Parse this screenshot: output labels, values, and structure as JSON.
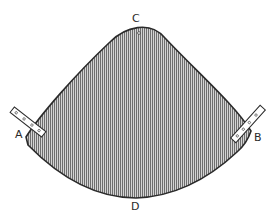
{
  "figure": {
    "colors": {
      "outline": "#2b2b2b",
      "hatch": "#6e6e6e",
      "fill": "#c9c9c9",
      "strap": "#ffffff"
    },
    "labels": {
      "top": "C",
      "left": "A",
      "right": "B",
      "bottom": "D"
    }
  }
}
